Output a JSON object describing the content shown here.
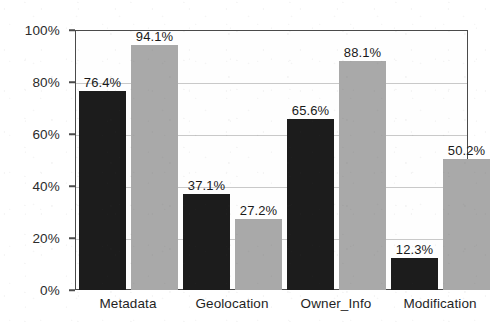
{
  "chart_data": {
    "type": "bar",
    "title": "",
    "subtitle": "",
    "xlabel": "",
    "ylabel": "",
    "categories": [
      "Metadata",
      "Geolocation",
      "Owner_Info",
      "Modification"
    ],
    "series": [
      {
        "name": "series-1-dark",
        "color": "#1c1c1c",
        "values": [
          76.4,
          37.1,
          65.6,
          12.3
        ],
        "labels": [
          "76.4%",
          "37.1%",
          "65.6%",
          "12.3%"
        ]
      },
      {
        "name": "series-2-gray",
        "color": "#a9a9a9",
        "values": [
          94.1,
          27.2,
          88.1,
          50.2
        ],
        "labels": [
          "94.1%",
          "27.2%",
          "88.1%",
          "50.2%"
        ]
      }
    ],
    "ylim": [
      0,
      100
    ],
    "ytick_values": [
      0,
      20,
      40,
      60,
      80,
      100
    ],
    "ytick_labels": [
      "0%",
      "20%",
      "40%",
      "60%",
      "80%",
      "100%"
    ],
    "grid": true,
    "grid_axis": "y",
    "legend": false,
    "legend_position": "none",
    "value_labels_shown": true,
    "units": "percent",
    "axis_color": "#4a4a4a",
    "grid_color": "#c9c9c9",
    "background_color": "#ffffff"
  }
}
